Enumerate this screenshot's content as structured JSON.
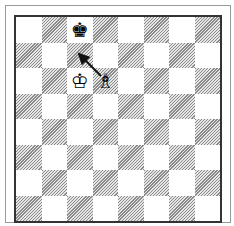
{
  "diagram": {
    "type": "chess-board",
    "orientation": "white-bottom",
    "top_left_square_color": "light",
    "colors": {
      "light": "#ffffff",
      "dark_hatch": "#8a8a8a",
      "border": "#333333",
      "frame": "#9a9a9a"
    },
    "pieces": [
      {
        "square": "c8",
        "piece": "black-king",
        "glyph": "♚"
      },
      {
        "square": "c6",
        "piece": "white-king",
        "glyph": "♔"
      },
      {
        "square": "d6",
        "piece": "white-bishop",
        "glyph": "♗"
      }
    ],
    "arrows": [
      {
        "from": "d6",
        "to": "c7"
      }
    ]
  }
}
